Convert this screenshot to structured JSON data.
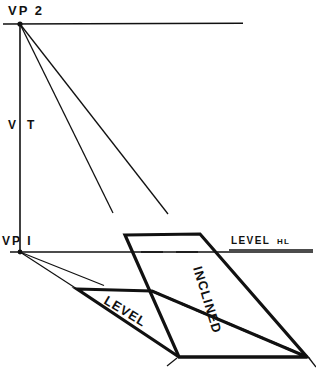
{
  "figure": {
    "width": 316,
    "height": 375,
    "background_color": "#ffffff",
    "ink_color": "#111111"
  },
  "labels": {
    "vp2": "VP 2",
    "vt": "V T",
    "vt_left": "V",
    "vt_right": "T",
    "vp1": "VP I",
    "level_hl_main": "LEVEL",
    "level_hl_sub": "HL",
    "level_plane": "LEVEL",
    "inclined_plane": "INCLINED"
  },
  "geometry": {
    "vp2_point": {
      "x": 20,
      "y": 24
    },
    "vp1_point": {
      "x": 20,
      "y": 252
    },
    "vertical_trace": {
      "x": 20,
      "y1": 24,
      "y2": 252
    },
    "top_line": {
      "x1": 3,
      "y": 24,
      "x2": 243
    },
    "horizon_line": {
      "x1": 10,
      "y": 252,
      "x2": 313
    },
    "vp2_rays": [
      {
        "x1": 20,
        "y1": 24,
        "x2": 113,
        "y2": 213
      },
      {
        "x1": 20,
        "y1": 24,
        "x2": 168,
        "y2": 214
      }
    ],
    "vp1_rays": [
      {
        "x1": 20,
        "y1": 252,
        "x2": 77,
        "y2": 289
      },
      {
        "x1": 20,
        "y1": 252,
        "x2": 104,
        "y2": 285
      }
    ],
    "inclined_plane_vertices": [
      {
        "x": 125,
        "y": 235
      },
      {
        "x": 200,
        "y": 234
      },
      {
        "x": 307,
        "y": 357
      },
      {
        "x": 179,
        "y": 357
      }
    ],
    "level_plane_vertices": [
      {
        "x": 77,
        "y": 289
      },
      {
        "x": 152,
        "y": 291
      },
      {
        "x": 307,
        "y": 357
      },
      {
        "x": 179,
        "y": 357
      }
    ],
    "hidden_edge_dashed": {
      "x1": 152,
      "y1": 291,
      "x2": 307,
      "y2": 357
    },
    "hl_dashes_over_plane": [
      {
        "x1": 141,
        "y": 252,
        "x2": 163
      },
      {
        "x1": 176,
        "y": 252,
        "x2": 198
      }
    ],
    "ground_ticks": [
      {
        "x1": 168,
        "y1": 365,
        "x2": 177,
        "y2": 359
      },
      {
        "x1": 309,
        "y1": 359,
        "x2": 316,
        "y2": 366
      }
    ],
    "label_rotations": {
      "level_plane_deg": 31,
      "inclined_plane_deg": 73
    }
  }
}
